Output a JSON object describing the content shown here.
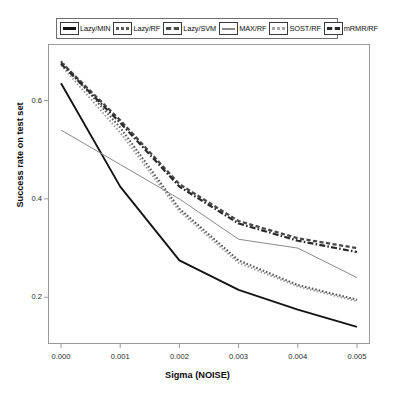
{
  "legend": {
    "position": "top",
    "entries": [
      {
        "label": "Lazy/MIN",
        "style": "solid-thick",
        "color": "#141414",
        "swatch": "solid-bar-icon"
      },
      {
        "label": "Lazy/RF",
        "style": "dotted-dense",
        "color": "#5a5a5a",
        "swatch": "dotted-bar-icon"
      },
      {
        "label": "Lazy/SVM",
        "style": "dash-dense",
        "color": "#4a4a4a",
        "swatch": "dashed-bar-icon"
      },
      {
        "label": "MAX/RF",
        "style": "solid-thin",
        "color": "#8a8a8a",
        "swatch": "thin-bar-icon"
      },
      {
        "label": "SOST/RF",
        "style": "dotted-light",
        "color": "#9c9c9c",
        "swatch": "light-dotted-bar-icon"
      },
      {
        "label": "mRMR/RF",
        "style": "dashdot",
        "color": "#2a2a2a",
        "swatch": "dashdot-bar-icon"
      }
    ]
  },
  "axes": {
    "x_title": "Sigma (NOISE)",
    "y_title": "Success rate on test set",
    "x_ticks": [
      "0.000",
      "0.001",
      "0.002",
      "0.003",
      "0.004",
      "0.005"
    ],
    "y_ticks": [
      "0.2",
      "0.4",
      "0.6"
    ]
  },
  "chart_data": {
    "type": "line",
    "title": "",
    "xlabel": "Sigma (NOISE)",
    "ylabel": "Success rate on test set",
    "x": [
      0.0,
      0.001,
      0.002,
      0.003,
      0.004,
      0.005
    ],
    "xlim": [
      -0.00022,
      0.00522
    ],
    "ylim": [
      0.105,
      0.715
    ],
    "grid": false,
    "legend_position": "top",
    "series": [
      {
        "name": "Lazy/MIN",
        "values": [
          0.635,
          0.425,
          0.275,
          0.215,
          0.175,
          0.14
        ],
        "color": "#141414",
        "style": "solid-thick"
      },
      {
        "name": "Lazy/RF",
        "values": [
          0.68,
          0.545,
          0.38,
          0.275,
          0.225,
          0.195
        ],
        "color": "#5a5a5a",
        "style": "dotted-dense"
      },
      {
        "name": "Lazy/SVM",
        "values": [
          0.678,
          0.56,
          0.43,
          0.355,
          0.32,
          0.3
        ],
        "color": "#4a4a4a",
        "style": "dash-dense"
      },
      {
        "name": "MAX/RF",
        "values": [
          0.54,
          0.47,
          0.4,
          0.318,
          0.3,
          0.24
        ],
        "color": "#8a8a8a",
        "style": "solid-thin"
      },
      {
        "name": "SOST/RF",
        "values": [
          0.672,
          0.535,
          0.375,
          0.27,
          0.222,
          0.192
        ],
        "color": "#9c9c9c",
        "style": "dotted-light"
      },
      {
        "name": "mRMR/RF",
        "values": [
          0.675,
          0.555,
          0.425,
          0.35,
          0.315,
          0.292
        ],
        "color": "#2a2a2a",
        "style": "dashdot"
      }
    ]
  }
}
